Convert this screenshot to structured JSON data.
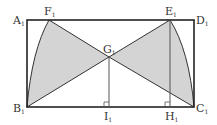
{
  "diagram": {
    "type": "geometry",
    "colors": {
      "stroke": "#222222",
      "fill": "#d4d4d4",
      "thin": "#555555"
    },
    "labels": {
      "A": "A",
      "B": "B",
      "C": "C",
      "D": "D",
      "E": "E",
      "F": "F",
      "G": "G",
      "H": "H",
      "I": "I",
      "sub": "1"
    },
    "points": {
      "A": [
        27,
        20
      ],
      "B": [
        27,
        107
      ],
      "C": [
        194,
        107
      ],
      "D": [
        194,
        20
      ],
      "E": [
        170,
        20
      ],
      "F": [
        49,
        20
      ],
      "G": [
        109,
        57
      ],
      "H": [
        170,
        107
      ],
      "I": [
        109,
        107
      ]
    },
    "shaded_regions": [
      "B-F-G (with arc B to F)",
      "C-E-G (with arc C to E)"
    ]
  }
}
